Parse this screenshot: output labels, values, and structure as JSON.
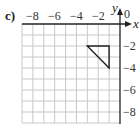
{
  "part_label": "c)",
  "axes": {
    "x_name": "x",
    "y_name": "y",
    "origin_label": "0",
    "x_ticks": [
      "−8",
      "−6",
      "−4",
      "−2"
    ],
    "y_ticks": [
      "−2",
      "−4",
      "−6",
      "−8"
    ],
    "x_range": [
      -9,
      0
    ],
    "y_range": [
      -9,
      0
    ],
    "grid": true,
    "grid_color": "#c8c8c8",
    "axis_color": "#222222"
  },
  "shape": {
    "type": "triangle",
    "vertices": [
      [
        -3,
        -2
      ],
      [
        -1,
        -2
      ],
      [
        -1,
        -4
      ]
    ],
    "stroke": "#222222"
  }
}
